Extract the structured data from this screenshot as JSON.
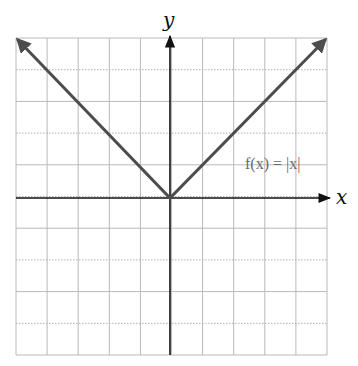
{
  "chart_data": {
    "type": "line",
    "title": "",
    "xlabel": "x",
    "ylabel": "y",
    "xlim": [
      -5,
      5
    ],
    "ylim": [
      -5,
      5
    ],
    "grid": true,
    "tick_labels_shown": false,
    "series": [
      {
        "name": "f(x) = |x|",
        "x": [
          -5,
          0,
          5
        ],
        "y": [
          5,
          0,
          5
        ],
        "arrows_at_ends": true,
        "color": "#4d4d4d"
      }
    ],
    "annotations": [
      {
        "text": "f(x) = |x|",
        "x": 3.1,
        "y": 1.1
      }
    ]
  },
  "labels": {
    "x_axis": "x",
    "y_axis": "y",
    "function": "f(x) = |x|"
  },
  "colors": {
    "curve": "#4d4d4d",
    "axes": "#111111",
    "grid": "#b9b9b9",
    "background": "#ffffff"
  }
}
